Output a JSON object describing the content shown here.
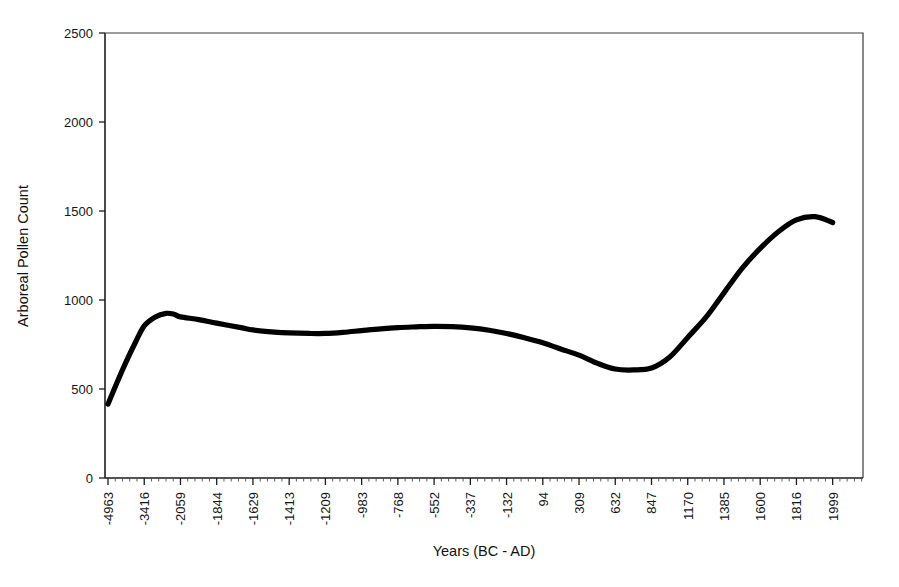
{
  "chart_data": {
    "type": "line",
    "title": "",
    "subtitle": "",
    "xlabel": "Years (BC - AD)",
    "ylabel": "Arboreal Pollen Count",
    "grid": false,
    "legend": null,
    "legend_position": "none",
    "annotations": [],
    "ylim": [
      0,
      2500
    ],
    "y_ticks": [
      0,
      500,
      1000,
      1500,
      2000,
      2500
    ],
    "y_tick_labels": [
      "0",
      "500",
      "1000",
      "1500",
      "2000",
      "2500"
    ],
    "x_tick_labels": [
      "-4963",
      "-3416",
      "-2059",
      "-1844",
      "-1629",
      "-1413",
      "-1209",
      "-983",
      "-768",
      "-552",
      "-337",
      "-132",
      "94",
      "309",
      "632",
      "847",
      "1170",
      "1385",
      "1600",
      "1816",
      "1999"
    ],
    "x_tick_label_rotation": -90,
    "series": [
      {
        "name": "Arboreal Pollen Count",
        "color": "#000000",
        "line_width": 5.2,
        "x": [
          "-4963",
          "-4600",
          "-4200",
          "-3800",
          "-3416",
          "-3000",
          "-2600",
          "-2300",
          "-2059",
          "-1950",
          "-1844",
          "-1700",
          "-1629",
          "-1500",
          "-1413",
          "-1300",
          "-1209",
          "-1100",
          "-983",
          "-870",
          "-768",
          "-660",
          "-552",
          "-445",
          "-337",
          "-230",
          "-132",
          "-20",
          "94",
          "200",
          "309",
          "470",
          "632",
          "740",
          "847",
          "1010",
          "1170",
          "1280",
          "1385",
          "1490",
          "1600",
          "1710",
          "1816",
          "1910",
          "1999"
        ],
        "values": [
          415,
          530,
          650,
          760,
          855,
          905,
          925,
          920,
          905,
          890,
          870,
          845,
          832,
          820,
          815,
          812,
          812,
          818,
          828,
          838,
          845,
          849,
          852,
          850,
          843,
          830,
          812,
          788,
          760,
          725,
          690,
          645,
          612,
          607,
          618,
          680,
          790,
          905,
          1040,
          1175,
          1290,
          1385,
          1450,
          1468,
          1435
        ]
      }
    ]
  },
  "axes": {
    "y_axis_title": "Arboreal Pollen Count",
    "x_axis_title": "Years (BC - AD)"
  }
}
